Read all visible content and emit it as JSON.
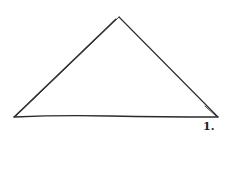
{
  "figure": {
    "shape": "triangle",
    "style": "hand-drawn sketch",
    "label": "1.",
    "stroke_color": "#2a2a2a",
    "background": "#ffffff",
    "vertices": {
      "apex": [
        119,
        17
      ],
      "left": [
        14,
        117
      ],
      "right": [
        218,
        117
      ]
    }
  }
}
